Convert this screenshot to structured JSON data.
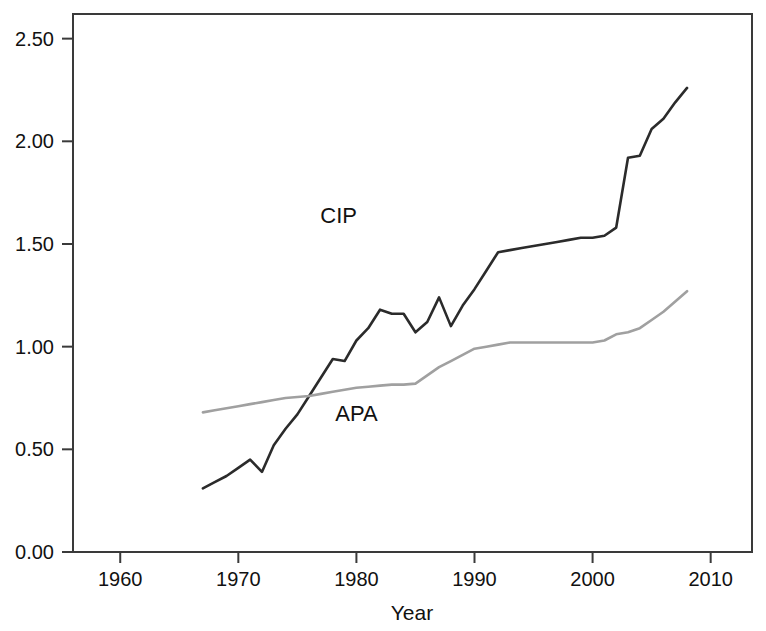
{
  "chart_data": {
    "type": "line",
    "title": "",
    "subtitle": "",
    "xlabel": "Year",
    "ylabel": "",
    "xlim": [
      1956,
      2013.5
    ],
    "ylim": [
      0.0,
      2.62
    ],
    "xticks": [
      1960,
      1970,
      1980,
      1990,
      2000,
      2010
    ],
    "xtick_labels": [
      "1960",
      "1970",
      "1980",
      "1990",
      "2000",
      "2010"
    ],
    "yticks": [
      0.0,
      0.5,
      1.0,
      1.5,
      2.0,
      2.5
    ],
    "ytick_labels": [
      "0.00",
      "0.50",
      "1.00",
      "1.50",
      "2.00",
      "2.50"
    ],
    "grid": false,
    "legend": "inline-annotations",
    "frame": true,
    "series": [
      {
        "name": "CIP",
        "color": "#2b2b2b",
        "width": 2.6,
        "label_x": 1978.5,
        "label_y": 1.6,
        "x": [
          1967,
          1968,
          1969,
          1970,
          1971,
          1972,
          1973,
          1974,
          1975,
          1976,
          1977,
          1978,
          1979,
          1980,
          1981,
          1982,
          1983,
          1984,
          1985,
          1986,
          1987,
          1988,
          1989,
          1990,
          1991,
          1992,
          1993,
          1994,
          1995,
          1996,
          1997,
          1998,
          1999,
          2000,
          2001,
          2002,
          2003,
          2004,
          2005,
          2006,
          2007,
          2008
        ],
        "y": [
          0.31,
          0.34,
          0.37,
          0.41,
          0.45,
          0.39,
          0.52,
          0.6,
          0.67,
          0.76,
          0.85,
          0.94,
          0.93,
          1.03,
          1.09,
          1.18,
          1.16,
          1.16,
          1.07,
          1.12,
          1.24,
          1.1,
          1.2,
          1.28,
          1.37,
          1.46,
          1.47,
          1.48,
          1.49,
          1.5,
          1.51,
          1.52,
          1.53,
          1.53,
          1.54,
          1.58,
          1.92,
          1.93,
          2.06,
          2.11,
          2.19,
          2.26
        ]
      },
      {
        "name": "APA",
        "color": "#a0a0a0",
        "width": 2.6,
        "label_x": 1980.0,
        "label_y": 0.64,
        "x": [
          1967,
          1968,
          1969,
          1970,
          1971,
          1972,
          1973,
          1974,
          1975,
          1976,
          1977,
          1978,
          1979,
          1980,
          1981,
          1982,
          1983,
          1984,
          1985,
          1986,
          1987,
          1988,
          1989,
          1990,
          1991,
          1992,
          1993,
          1994,
          1995,
          1996,
          1997,
          1998,
          1999,
          2000,
          2001,
          2002,
          2003,
          2004,
          2005,
          2006,
          2007,
          2008
        ],
        "y": [
          0.68,
          0.69,
          0.7,
          0.71,
          0.72,
          0.73,
          0.74,
          0.75,
          0.755,
          0.76,
          0.77,
          0.78,
          0.79,
          0.8,
          0.805,
          0.81,
          0.815,
          0.815,
          0.82,
          0.86,
          0.9,
          0.93,
          0.96,
          0.99,
          1.0,
          1.01,
          1.02,
          1.02,
          1.02,
          1.02,
          1.02,
          1.02,
          1.02,
          1.02,
          1.03,
          1.06,
          1.07,
          1.09,
          1.13,
          1.17,
          1.22,
          1.27
        ]
      }
    ]
  }
}
